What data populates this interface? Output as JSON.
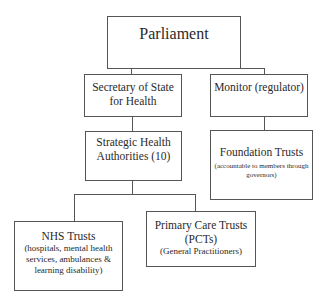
{
  "diagram": {
    "nodes": {
      "parliament": {
        "title": "Parliament"
      },
      "secretary": {
        "title": "Secretary of State for Health"
      },
      "monitor": {
        "title": "Monitor (regulator)"
      },
      "strategic": {
        "title": "Strategic Health Authorities (10)"
      },
      "foundation": {
        "title": "Foundation Trusts",
        "subtitle": "(accountable to members through governors)"
      },
      "nhs": {
        "title": "NHS Trusts",
        "subtitle": "(hospitals, mental health services, ambulances & learning disability)"
      },
      "pct": {
        "title": "Primary Care Trusts (PCTs)",
        "subtitle": "(General Practitioners)"
      }
    },
    "edges": [
      [
        "parliament",
        "secretary"
      ],
      [
        "parliament",
        "monitor"
      ],
      [
        "secretary",
        "strategic"
      ],
      [
        "monitor",
        "foundation"
      ],
      [
        "strategic",
        "nhs"
      ],
      [
        "strategic",
        "pct"
      ]
    ]
  }
}
